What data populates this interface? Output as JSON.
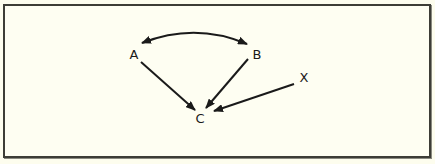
{
  "diagram": {
    "type": "causal-graph",
    "colors": {
      "background": "#fdfdee",
      "frame": "#3d3d36",
      "edge": "#1a1a1a",
      "text": "#1a1a1a"
    },
    "nodes": [
      {
        "id": "A",
        "label": "A",
        "x": 133,
        "y": 53
      },
      {
        "id": "B",
        "label": "B",
        "x": 257,
        "y": 53
      },
      {
        "id": "C",
        "label": "C",
        "x": 200,
        "y": 117
      },
      {
        "id": "X",
        "label": "X",
        "x": 304,
        "y": 77
      }
    ],
    "edges": [
      {
        "from": "A",
        "to": "B",
        "style": "curved",
        "direction": "bidirectional"
      },
      {
        "from": "A",
        "to": "C",
        "style": "straight",
        "direction": "forward"
      },
      {
        "from": "B",
        "to": "C",
        "style": "straight",
        "direction": "forward"
      },
      {
        "from": "X",
        "to": "C",
        "style": "straight",
        "direction": "forward"
      }
    ]
  }
}
